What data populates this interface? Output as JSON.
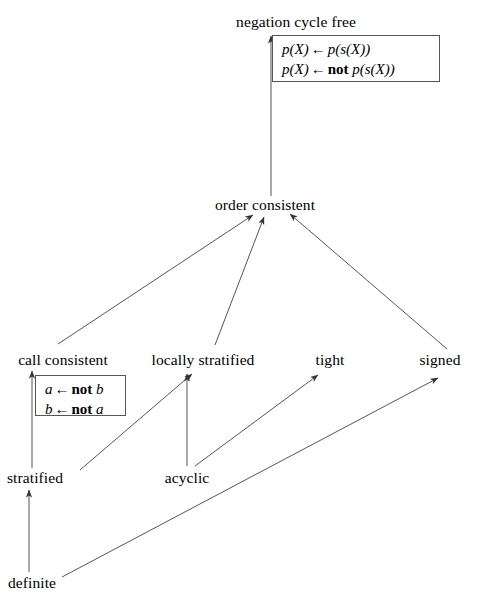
{
  "diagram": {
    "background_color": "#ffffff",
    "line_color": "#555555",
    "text_color": "#000000",
    "nodes": [
      {
        "id": "negation-cycle-free",
        "label": "negation cycle free",
        "x": 296,
        "y": 22
      },
      {
        "id": "order-consistent",
        "label": "order consistent",
        "x": 265,
        "y": 205
      },
      {
        "id": "call-consistent",
        "label": "call consistent",
        "x": 63,
        "y": 360
      },
      {
        "id": "locally-stratified",
        "label": "locally stratified",
        "x": 203,
        "y": 360
      },
      {
        "id": "tight",
        "label": "tight",
        "x": 330,
        "y": 360
      },
      {
        "id": "signed",
        "label": "signed",
        "x": 440,
        "y": 360
      },
      {
        "id": "stratified",
        "label": "stratified",
        "x": 35,
        "y": 478
      },
      {
        "id": "acyclic",
        "label": "acyclic",
        "x": 187,
        "y": 478
      },
      {
        "id": "definite",
        "label": "definite",
        "x": 32,
        "y": 583
      }
    ],
    "edges": [
      {
        "from": "order-consistent",
        "to": "negation-cycle-free",
        "kind": "vertical"
      },
      {
        "from": "call-consistent",
        "to": "order-consistent",
        "kind": "diagonal"
      },
      {
        "from": "locally-stratified",
        "to": "order-consistent",
        "kind": "diagonal"
      },
      {
        "from": "signed",
        "to": "order-consistent",
        "kind": "diagonal"
      },
      {
        "from": "stratified",
        "to": "call-consistent",
        "kind": "vertical"
      },
      {
        "from": "stratified",
        "to": "locally-stratified",
        "kind": "diagonal"
      },
      {
        "from": "acyclic",
        "to": "locally-stratified",
        "kind": "vertical"
      },
      {
        "from": "acyclic",
        "to": "tight",
        "kind": "diagonal"
      },
      {
        "from": "definite",
        "to": "stratified",
        "kind": "vertical"
      },
      {
        "from": "definite",
        "to": "signed",
        "kind": "diagonal"
      }
    ],
    "rule_boxes": [
      {
        "id": "negation-cycle-free-example",
        "attached_to": "negation-cycle-free",
        "x": 272,
        "y": 35,
        "width": 168,
        "height": 47,
        "lines": [
          {
            "head": "p(X)",
            "arrow": "←",
            "negation": "",
            "body": "p(s(X))"
          },
          {
            "head": "p(X)",
            "arrow": "←",
            "negation": "not",
            "body": "p(s(X))"
          }
        ]
      },
      {
        "id": "call-consistent-example",
        "attached_to": "call-consistent",
        "x": 35,
        "y": 375,
        "width": 91,
        "height": 41,
        "lines": [
          {
            "head": "a",
            "arrow": "←",
            "negation": "not",
            "body": "b"
          },
          {
            "head": "b",
            "arrow": "←",
            "negation": "not",
            "body": "a"
          }
        ]
      }
    ]
  }
}
